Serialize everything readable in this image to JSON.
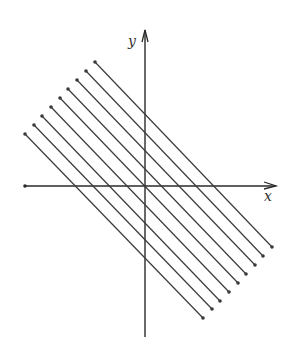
{
  "diagram": {
    "axis_labels": {
      "x": "x",
      "y": "y"
    },
    "colors": {
      "line": "#3a3a3a",
      "axis": "#2a2a2a",
      "background": "#ffffff"
    },
    "axes": {
      "x_axis": {
        "x1": 25,
        "y1": 186,
        "x2": 276,
        "y2": 186
      },
      "y_axis": {
        "x1": 145,
        "y1": 337,
        "x2": 145,
        "y2": 30
      }
    },
    "lines": [
      {
        "x1": 95,
        "y1": 62,
        "x2": 272,
        "y2": 247
      },
      {
        "x1": 86,
        "y1": 71,
        "x2": 263,
        "y2": 256
      },
      {
        "x1": 77,
        "y1": 80,
        "x2": 255,
        "y2": 265
      },
      {
        "x1": 68,
        "y1": 89,
        "x2": 246,
        "y2": 274
      },
      {
        "x1": 60,
        "y1": 98,
        "x2": 238,
        "y2": 283
      },
      {
        "x1": 51,
        "y1": 107,
        "x2": 229,
        "y2": 292
      },
      {
        "x1": 42,
        "y1": 116,
        "x2": 220,
        "y2": 301
      },
      {
        "x1": 34,
        "y1": 125,
        "x2": 212,
        "y2": 309
      },
      {
        "x1": 25,
        "y1": 134,
        "x2": 203,
        "y2": 318
      }
    ]
  }
}
